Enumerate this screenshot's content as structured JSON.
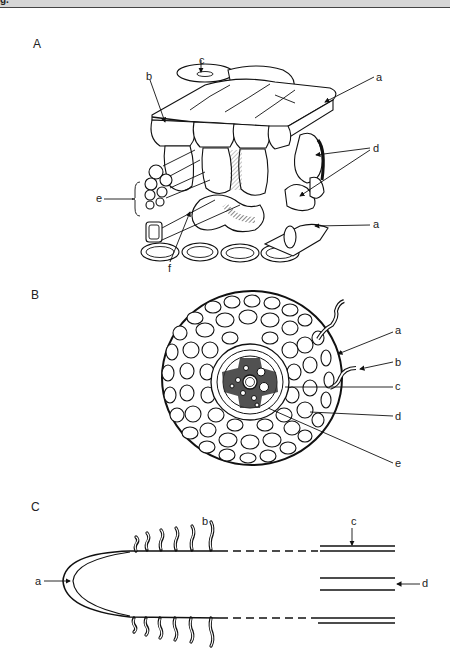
{
  "header": {
    "title_fragment": "g."
  },
  "figure": {
    "panels": [
      {
        "id": "A",
        "letter": "A",
        "description": "3D block diagram of leaf tissue",
        "labels": {
          "a_top": "a",
          "a_bottom": "a",
          "b": "b",
          "c": "c",
          "d": "d",
          "e": "e",
          "f": "f"
        }
      },
      {
        "id": "B",
        "letter": "B",
        "description": "Cross-section of root",
        "labels": {
          "a": "a",
          "b": "b",
          "c": "c",
          "d": "d",
          "e": "e"
        }
      },
      {
        "id": "C",
        "letter": "C",
        "description": "Longitudinal view of root tip",
        "labels": {
          "a": "a",
          "b": "b",
          "c": "c",
          "d": "d"
        }
      }
    ]
  },
  "colors": {
    "ink": "#111111",
    "background": "#ffffff",
    "topbar": "#d6d6d6"
  }
}
